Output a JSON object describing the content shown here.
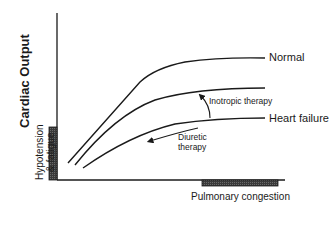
{
  "diagram": {
    "y_axis_title": "Cardiac Output",
    "x_axis_region_label": "Pulmonary congestion",
    "y_axis_region_label_line1": "Hypotension",
    "y_axis_region_label_line2": "& fatigue",
    "curves": [
      {
        "label": "Normal"
      },
      {
        "label": ""
      },
      {
        "label": "Heart failure"
      }
    ],
    "annotations": {
      "inotropic": "Inotropic therapy",
      "diuretic_line1": "Diuretic",
      "diuretic_line2": "therapy"
    },
    "colors": {
      "line": "#1a1a1a",
      "block": "#4a4a4a"
    }
  }
}
